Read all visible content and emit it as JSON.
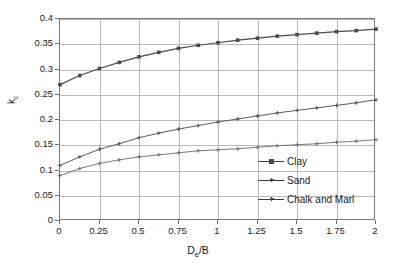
{
  "chart_data": {
    "type": "line",
    "title": "",
    "xlabel": "Dₑ/B",
    "xlabel_base": "D",
    "xlabel_sub": "e",
    "xlabel_tail": "/B",
    "ylabel": "kᴄ",
    "ylabel_base": "k",
    "ylabel_sub": "c",
    "xlim": [
      0,
      2
    ],
    "ylim": [
      0,
      0.4
    ],
    "grid": true,
    "legend_position": "bottom-right",
    "xticks": [
      "0",
      "0.25",
      "0.5",
      "0.75",
      "1",
      "1.25",
      "1.5",
      "1.75",
      "2"
    ],
    "xtick_values": [
      0,
      0.25,
      0.5,
      0.75,
      1,
      1.25,
      1.5,
      1.75,
      2
    ],
    "yticks": [
      "0",
      "0.05",
      "0.1",
      "0.15",
      "0.2",
      "0.25",
      "0.3",
      "0.35",
      "0.4"
    ],
    "ytick_values": [
      0,
      0.05,
      0.1,
      0.15,
      0.2,
      0.25,
      0.3,
      0.35,
      0.4
    ],
    "x": [
      0,
      0.125,
      0.25,
      0.375,
      0.5,
      0.625,
      0.75,
      0.875,
      1.0,
      1.125,
      1.25,
      1.375,
      1.5,
      1.625,
      1.75,
      1.875,
      2.0
    ],
    "series": [
      {
        "name": "Clay",
        "marker": "square",
        "color": "#4a4a4a",
        "values": [
          0.27,
          0.288,
          0.302,
          0.314,
          0.325,
          0.334,
          0.342,
          0.348,
          0.353,
          0.358,
          0.362,
          0.366,
          0.369,
          0.372,
          0.375,
          0.377,
          0.38
        ]
      },
      {
        "name": "Sand",
        "marker": "plus",
        "color": "#4a4a4a",
        "values": [
          0.11,
          0.127,
          0.142,
          0.153,
          0.165,
          0.174,
          0.182,
          0.189,
          0.196,
          0.202,
          0.208,
          0.214,
          0.219,
          0.224,
          0.229,
          0.234,
          0.24
        ]
      },
      {
        "name": "Chalk and Marl",
        "marker": "plus",
        "color": "#6a6a6a",
        "values": [
          0.09,
          0.104,
          0.114,
          0.121,
          0.127,
          0.131,
          0.135,
          0.139,
          0.141,
          0.143,
          0.146,
          0.149,
          0.151,
          0.153,
          0.156,
          0.158,
          0.161
        ]
      }
    ]
  },
  "legend": {
    "items": [
      {
        "label": "Clay"
      },
      {
        "label": "Sand"
      },
      {
        "label": "Chalk and Marl"
      }
    ]
  }
}
